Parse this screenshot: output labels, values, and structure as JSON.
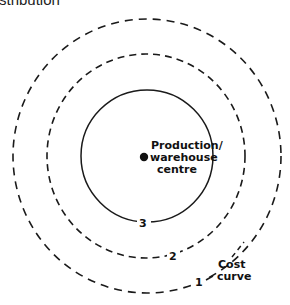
{
  "header": {
    "text": "stribution"
  },
  "diagram": {
    "centre_label": {
      "line1": "Production/",
      "line2": "warehouse",
      "line3": "centre"
    },
    "curves": [
      {
        "id": "1",
        "label": "1",
        "style": "dashed",
        "rx": 134,
        "ry": 137
      },
      {
        "id": "2",
        "label": "2",
        "style": "dashed",
        "rx": 99,
        "ry": 102
      },
      {
        "id": "3",
        "label": "3",
        "style": "solid",
        "rx": 66,
        "ry": 66
      }
    ],
    "legend": {
      "line1": "Cost",
      "line2": "curve"
    },
    "color": "#1a1a1a"
  }
}
